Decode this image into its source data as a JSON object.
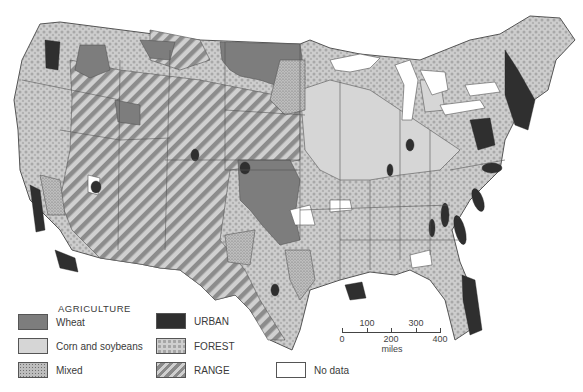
{
  "map": {
    "subject": "Contiguous United States land use",
    "colors": {
      "wheat": "#7d7d7d",
      "corn_soybeans": "#d6d6d6",
      "mixed": "#bdbdbd",
      "urban": "#2f2f2f",
      "forest": "#cfcfcf",
      "range_dark": "#8a8a8a",
      "range_light": "#d0d0d0",
      "no_data": "#ffffff",
      "border": "#444444"
    }
  },
  "legend": {
    "agriculture_title": "AGRICULTURE",
    "items": [
      {
        "key": "wheat",
        "label": "Wheat"
      },
      {
        "key": "corn_soybeans",
        "label": "Corn and soybeans"
      },
      {
        "key": "mixed",
        "label": "Mixed"
      },
      {
        "key": "urban",
        "label": "URBAN"
      },
      {
        "key": "forest",
        "label": "FOREST"
      },
      {
        "key": "range",
        "label": "RANGE"
      },
      {
        "key": "no_data",
        "label": "No data"
      }
    ]
  },
  "scale": {
    "top_labels": [
      "100",
      "300"
    ],
    "bottom_labels": [
      "0",
      "200",
      "400"
    ],
    "unit": "miles"
  }
}
